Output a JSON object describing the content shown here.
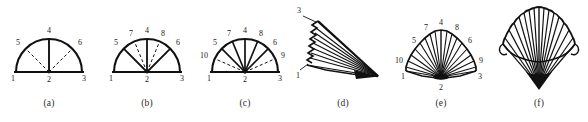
{
  "figure": {
    "background_color": "#ffffff",
    "ink_color": "#111111",
    "panel_count": 6
  },
  "panels": [
    {
      "id": "a",
      "caption": "(a)",
      "type": "semicircle-fan",
      "description": "Semicircular arc on a horizontal baseline with one solid radial spoke and two dashed radial spokes",
      "labels": [
        "1",
        "2",
        "3",
        "4",
        "5",
        "6"
      ],
      "label_positions": {
        "1": "baseline-left-end",
        "2": "baseline-center",
        "3": "baseline-right-end",
        "4": "arc-top",
        "5": "arc-upper-left",
        "6": "arc-upper-right"
      },
      "solid_spokes": [
        "4"
      ],
      "dashed_spokes": [
        "5",
        "6"
      ],
      "spoke_count": 3
    },
    {
      "id": "b",
      "caption": "(b)",
      "type": "semicircle-fan",
      "description": "Semicircular arc with solid spokes to 5, 4, 6 and dashed spokes to 7 and 8",
      "labels": [
        "1",
        "2",
        "3",
        "4",
        "5",
        "6",
        "7",
        "8"
      ],
      "label_positions": {
        "1": "baseline-left-end",
        "2": "baseline-center",
        "3": "baseline-right-end",
        "4": "arc-top",
        "5": "arc-upper-left",
        "6": "arc-upper-right",
        "7": "arc-between-5-and-4",
        "8": "arc-between-4-and-6"
      },
      "solid_spokes": [
        "5",
        "4",
        "6"
      ],
      "dashed_spokes": [
        "7",
        "8"
      ],
      "spoke_count": 5
    },
    {
      "id": "c",
      "caption": "(c)",
      "type": "semicircle-fan",
      "description": "Semicircular arc with solid spokes to 5, 7, 4, 8, 6 and dashed spokes to 10 and 9 near the baseline",
      "labels": [
        "1",
        "2",
        "3",
        "4",
        "5",
        "6",
        "7",
        "8",
        "9",
        "10"
      ],
      "label_positions": {
        "1": "baseline-left-end",
        "2": "baseline-center",
        "3": "baseline-right-end",
        "4": "arc-top",
        "5": "arc-upper-left",
        "6": "arc-upper-right",
        "7": "arc-between-5-and-4",
        "8": "arc-between-4-and-6",
        "9": "arc-lower-right",
        "10": "arc-lower-left"
      },
      "solid_spokes": [
        "5",
        "7",
        "4",
        "8",
        "6"
      ],
      "dashed_spokes": [
        "10",
        "9"
      ],
      "spoke_count": 7
    },
    {
      "id": "d",
      "caption": "(d)",
      "type": "collapsed-fan-perspective",
      "description": "Fan shown nearly closed in perspective; pleats converge to a sharp point at lower right",
      "labels": [
        "3",
        "1"
      ],
      "label_positions": {
        "3": "upper-left-leader",
        "1": "lower-left-leader"
      },
      "pleat_count": 8
    },
    {
      "id": "e",
      "caption": "(e)",
      "type": "open-fan-perspective",
      "description": "Fully opened pleated fan in perspective with numbered pleat tips around the rim",
      "labels": [
        "1",
        "2",
        "3",
        "5",
        "6",
        "7",
        "8",
        "9",
        "10"
      ],
      "label_positions": {
        "1": "rim-far-left-lower",
        "2": "hub-below",
        "3": "rim-far-right-lower",
        "4": "rim-top-center",
        "5": "rim-upper-left",
        "6": "rim-upper-right",
        "7": "rim-left-of-top",
        "8": "rim-right-of-top",
        "9": "rim-right-lower",
        "10": "rim-left-lower"
      },
      "pleat_count": 18
    },
    {
      "id": "f",
      "caption": "(f)",
      "type": "shell-fan-perspective",
      "description": "Pleated shell-like fan with scalloped upper edge converging to a dark point at the bottom; no labels",
      "labels": [],
      "label_positions": {},
      "pleat_count": 16
    }
  ],
  "captions": {
    "a": "(a)",
    "b": "(b)",
    "c": "(c)",
    "d": "(d)",
    "e": "(e)",
    "f": "(f)"
  }
}
